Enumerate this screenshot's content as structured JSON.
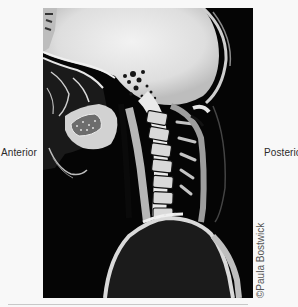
{
  "figure": {
    "labels": {
      "left": "Anterior",
      "right": "Posterior"
    },
    "credit": "©Paula Bostwick"
  },
  "colors": {
    "page_background": "#f8f8f8",
    "image_background": "#050505",
    "tissue_bright": "#e8e8e8",
    "label_text": "#2a2a2a",
    "credit_text": "#555555"
  }
}
